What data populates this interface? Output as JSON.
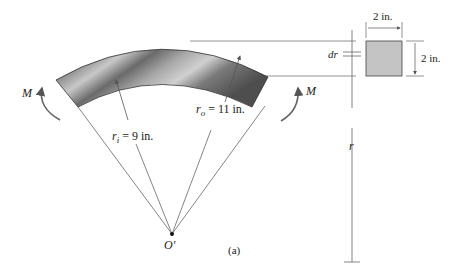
{
  "figure": {
    "caption": "(a)",
    "center_label": "O'",
    "moment_left": "M",
    "moment_right": "M",
    "inner_radius": {
      "symbol": "r",
      "subscript": "i",
      "value": " = 9 in."
    },
    "outer_radius": {
      "symbol": "r",
      "subscript": "o",
      "value": " = 11 in."
    },
    "dr_label": "dr",
    "r_label": "r",
    "section_width": "2 in.",
    "section_height": "2 in."
  },
  "colors": {
    "beam_dark": "#5a5a5a",
    "beam_light": "#bdbdbd",
    "section_fill": "#c4c4c4",
    "line": "#555555"
  }
}
